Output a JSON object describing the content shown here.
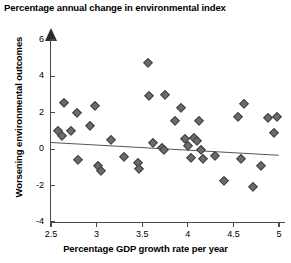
{
  "chart_data": {
    "type": "scatter",
    "title": "Percentage annual change in environmental index",
    "xlabel": "Percentage GDP growth rate per year",
    "ylabel": "Worsening environmental outcomes",
    "xlim": [
      2.5,
      5.0
    ],
    "ylim": [
      -4,
      6
    ],
    "xticks": [
      2.5,
      3,
      3.5,
      4,
      4.5,
      5
    ],
    "xtick_labels": [
      "2.5",
      "3",
      "3.5",
      "4",
      "4.5",
      "5"
    ],
    "yticks": [
      6,
      4,
      2,
      0,
      -2,
      -4
    ],
    "ytick_labels": [
      "6",
      "4",
      "2",
      "0",
      "-2",
      "-4"
    ],
    "grid": false,
    "legend": null,
    "marker": "diamond",
    "marker_color": "#6b6b6b",
    "axis_color": "#4a4a4a",
    "points": [
      {
        "x": 2.58,
        "y": 1.0
      },
      {
        "x": 2.62,
        "y": 0.75
      },
      {
        "x": 2.64,
        "y": 2.55
      },
      {
        "x": 2.72,
        "y": 1.0
      },
      {
        "x": 2.78,
        "y": 2.0
      },
      {
        "x": 2.8,
        "y": -0.6
      },
      {
        "x": 2.93,
        "y": 1.3
      },
      {
        "x": 2.98,
        "y": 2.35
      },
      {
        "x": 3.02,
        "y": -0.9
      },
      {
        "x": 3.05,
        "y": -1.2
      },
      {
        "x": 3.16,
        "y": 0.5
      },
      {
        "x": 3.3,
        "y": -0.45
      },
      {
        "x": 3.45,
        "y": -0.75
      },
      {
        "x": 3.47,
        "y": -1.1
      },
      {
        "x": 3.56,
        "y": 4.75
      },
      {
        "x": 3.58,
        "y": 2.9
      },
      {
        "x": 3.62,
        "y": 0.35
      },
      {
        "x": 3.72,
        "y": 0.05
      },
      {
        "x": 3.74,
        "y": -0.05
      },
      {
        "x": 3.75,
        "y": 3.0
      },
      {
        "x": 3.86,
        "y": 1.55
      },
      {
        "x": 3.92,
        "y": 2.25
      },
      {
        "x": 3.97,
        "y": 0.55
      },
      {
        "x": 4.0,
        "y": 0.2
      },
      {
        "x": 4.03,
        "y": -0.5
      },
      {
        "x": 4.07,
        "y": 0.6
      },
      {
        "x": 4.1,
        "y": 0.45
      },
      {
        "x": 4.12,
        "y": 1.55
      },
      {
        "x": 4.15,
        "y": -0.05
      },
      {
        "x": 4.17,
        "y": -0.55
      },
      {
        "x": 4.3,
        "y": -0.35
      },
      {
        "x": 4.4,
        "y": -1.75
      },
      {
        "x": 4.55,
        "y": 1.75
      },
      {
        "x": 4.58,
        "y": -0.55
      },
      {
        "x": 4.62,
        "y": 2.5
      },
      {
        "x": 4.72,
        "y": -2.1
      },
      {
        "x": 4.8,
        "y": -0.95
      },
      {
        "x": 4.88,
        "y": 1.7
      },
      {
        "x": 4.95,
        "y": 0.9
      },
      {
        "x": 4.98,
        "y": 1.75
      }
    ],
    "trend_line": {
      "x1": 2.5,
      "y1": 0.38,
      "x2": 5.0,
      "y2": -0.32
    }
  }
}
